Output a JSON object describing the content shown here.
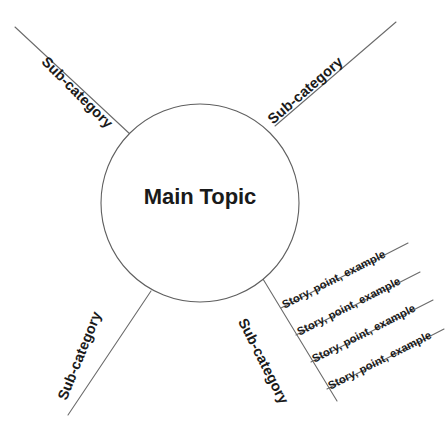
{
  "diagram": {
    "type": "mind-map",
    "background_color": "#ffffff",
    "line_color": "#6b6b6b",
    "text_color": "#1a1a1a",
    "center": {
      "label": "Main Topic",
      "shape": "circle",
      "cx": 200,
      "cy": 203,
      "r": 99
    },
    "branches": [
      {
        "label": "Sub-category",
        "position": "top-left",
        "rotation_deg": 45,
        "label_x": 44,
        "label_y": 52,
        "line": {
          "x1": 15,
          "y1": 27,
          "x2": 131,
          "y2": 135
        }
      },
      {
        "label": "Sub-category",
        "position": "top-right",
        "rotation_deg": -41,
        "label_x": 270,
        "label_y": 114,
        "line": {
          "x1": 396,
          "y1": 22,
          "x2": 275,
          "y2": 126
        }
      },
      {
        "label": "Sub-category",
        "position": "bottom-left",
        "rotation_deg": -68,
        "label_x": 62,
        "label_y": 392,
        "line": {
          "x1": 68,
          "y1": 415,
          "x2": 151,
          "y2": 291
        }
      },
      {
        "label": "Sub-category",
        "position": "bottom-right",
        "rotation_deg": 63,
        "label_x": 242,
        "label_y": 312,
        "line": {
          "x1": 263,
          "y1": 279,
          "x2": 337,
          "y2": 401
        }
      }
    ],
    "leaves": [
      {
        "label": "Story, point, example",
        "rotation_deg": -27,
        "label_x": 283,
        "label_y": 300,
        "line": {
          "x1": 281,
          "y1": 308,
          "x2": 408,
          "y2": 243
        }
      },
      {
        "label": "Story, point, example",
        "rotation_deg": -27,
        "label_x": 298,
        "label_y": 327,
        "line": {
          "x1": 296,
          "y1": 335,
          "x2": 420,
          "y2": 272
        }
      },
      {
        "label": "Story, point, example",
        "rotation_deg": -27,
        "label_x": 313,
        "label_y": 354,
        "line": {
          "x1": 311,
          "y1": 362,
          "x2": 433,
          "y2": 300
        }
      },
      {
        "label": "Story, point, example",
        "rotation_deg": -27,
        "label_x": 329,
        "label_y": 381,
        "line": {
          "x1": 327,
          "y1": 389,
          "x2": 444,
          "y2": 329
        }
      }
    ]
  }
}
